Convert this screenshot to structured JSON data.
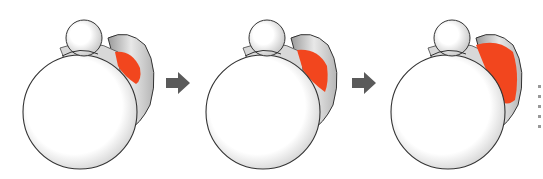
{
  "diagram": {
    "title": "",
    "stages": [
      {
        "id": 1,
        "label": "",
        "lesion_size": "small",
        "x": 0
      },
      {
        "id": 2,
        "label": "",
        "lesion_size": "medium",
        "x": 183
      },
      {
        "id": 3,
        "label": "",
        "lesion_size": "large",
        "x": 368
      }
    ],
    "arrows": [
      {
        "from": 1,
        "to": 2,
        "x": 165
      },
      {
        "from": 2,
        "to": 3,
        "x": 350
      }
    ],
    "colors": {
      "lesion": "#f2461e",
      "arrow": "#5a5a5a",
      "outline": "#333333",
      "shading": "#bdbdbd"
    },
    "edge_text": "truncated illegible text at right edge"
  }
}
